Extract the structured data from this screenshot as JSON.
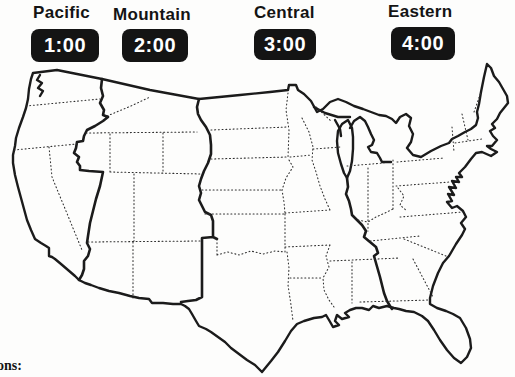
{
  "timezones": [
    {
      "label": "Pacific",
      "time": "1:00"
    },
    {
      "label": "Mountain",
      "time": "2:00"
    },
    {
      "label": "Central",
      "time": "3:00"
    },
    {
      "label": "Eastern",
      "time": "4:00"
    }
  ],
  "footer": {
    "partial_text": "ons:"
  },
  "map": {
    "description": "United States map with time zone boundaries (thick lines) and state borders (dotted lines)",
    "line_color": "#1b1b1b",
    "background": "#fdfdfc",
    "clock_bg": "#141414",
    "clock_text_color": "#ffffff"
  }
}
